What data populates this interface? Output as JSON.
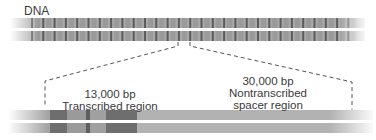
{
  "diagram": {
    "title": "DNA",
    "top_strand": {
      "description": "Tandemly repeated rRNA gene units",
      "repeat_count": 29,
      "colors": {
        "band": "#a9a9a9",
        "stripe": "#5c5c5c",
        "fade": "#ffffff"
      }
    },
    "expanded_unit": {
      "transcribed": {
        "size": "13,000 bp",
        "label": "Transcribed region"
      },
      "spacer": {
        "size": "30,000 bp",
        "label_line1": "Nontranscribed",
        "label_line2": "spacer region"
      },
      "colors": {
        "base": "#a4a4a4",
        "dark": "#6e6e6e",
        "light": "#b8b8b8"
      }
    }
  }
}
